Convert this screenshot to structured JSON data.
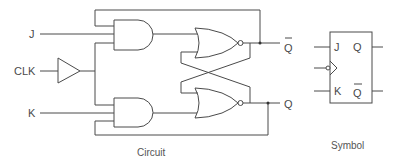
{
  "diagram": {
    "circuit": {
      "caption": "Circuit",
      "inputs": [
        {
          "label": "J"
        },
        {
          "label": "CLK"
        },
        {
          "label": "K"
        }
      ],
      "outputs": [
        {
          "label": "Q",
          "inverted": true
        },
        {
          "label": "Q",
          "inverted": false
        }
      ],
      "gates": [
        "buffer",
        "and-top",
        "and-bottom",
        "nor-top",
        "nor-bottom"
      ]
    },
    "symbol": {
      "caption": "Symbol",
      "pins": {
        "j": "J",
        "k": "K",
        "q": "Q",
        "qbar": "Q"
      },
      "clock": "negative-edge"
    },
    "colors": {
      "line": "#4a4a4a",
      "text": "#4a4a4a",
      "background": "#ffffff"
    }
  }
}
